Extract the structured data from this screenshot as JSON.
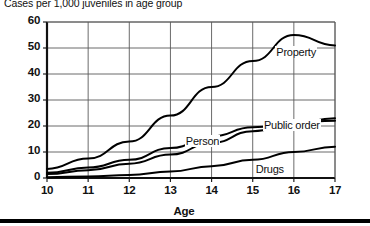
{
  "chart_data": {
    "type": "line",
    "title": "Cases per 1,000 juveniles in age group",
    "xlabel": "Age",
    "ylabel": "",
    "x": [
      10,
      11,
      12,
      13,
      14,
      15,
      16,
      17
    ],
    "xlim": [
      10,
      17
    ],
    "ylim": [
      0,
      60
    ],
    "xticks": [
      "10",
      "11",
      "12",
      "13",
      "14",
      "15",
      "16",
      "17"
    ],
    "yticks": [
      "0",
      "10",
      "20",
      "30",
      "40",
      "50",
      "60"
    ],
    "grid": true,
    "legend": "inline-labels",
    "series": [
      {
        "name": "Property",
        "label": "Property",
        "values": [
          3.5,
          7.5,
          14.0,
          24.0,
          35.0,
          45.0,
          55.0,
          51.0
        ]
      },
      {
        "name": "Person",
        "label": "Person",
        "values": [
          2.0,
          4.0,
          7.0,
          11.5,
          16.0,
          19.5,
          21.5,
          22.0
        ]
      },
      {
        "name": "Public order",
        "label": "Public order",
        "values": [
          1.5,
          3.0,
          5.5,
          9.0,
          13.5,
          18.0,
          21.0,
          23.0
        ]
      },
      {
        "name": "Drugs",
        "label": "Drugs",
        "values": [
          0.3,
          0.6,
          1.2,
          2.5,
          4.5,
          7.0,
          10.0,
          12.0
        ]
      }
    ]
  },
  "figure": {
    "bottom_rule": "divider"
  }
}
